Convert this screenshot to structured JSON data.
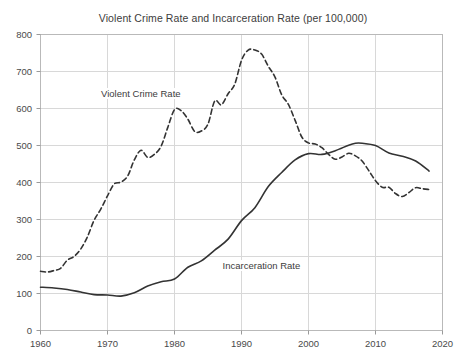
{
  "chart_data": {
    "type": "line",
    "title": "Violent Crime Rate and Incarceration Rate (per 100,000)",
    "xlabel": "",
    "ylabel": "",
    "xlim": [
      1960,
      2020
    ],
    "ylim": [
      0,
      800
    ],
    "grid": true,
    "legend_position": "inline-annotation",
    "xticks": [
      1960,
      1970,
      1980,
      1990,
      2000,
      2010,
      2020
    ],
    "yticks": [
      0,
      100,
      200,
      300,
      400,
      500,
      600,
      700,
      800
    ],
    "annotations": [
      {
        "text": "Violent Crime Rate",
        "x": 1975,
        "y": 640
      },
      {
        "text": "Incarceration Rate",
        "x": 1993,
        "y": 175
      }
    ],
    "series": [
      {
        "name": "Violent Crime Rate",
        "style": "dashed",
        "color": "#333333",
        "x": [
          1960,
          1961,
          1962,
          1963,
          1964,
          1965,
          1966,
          1967,
          1968,
          1969,
          1970,
          1971,
          1972,
          1973,
          1974,
          1975,
          1976,
          1977,
          1978,
          1979,
          1980,
          1981,
          1982,
          1983,
          1984,
          1985,
          1986,
          1987,
          1988,
          1989,
          1990,
          1991,
          1992,
          1993,
          1994,
          1995,
          1996,
          1997,
          1998,
          1999,
          2000,
          2001,
          2002,
          2003,
          2004,
          2005,
          2006,
          2007,
          2008,
          2009,
          2010,
          2011,
          2012,
          2013,
          2014,
          2015,
          2016,
          2017,
          2018
        ],
        "values": [
          160,
          158,
          162,
          168,
          190,
          200,
          220,
          253,
          298,
          328,
          364,
          396,
          401,
          417,
          461,
          487,
          468,
          476,
          498,
          549,
          597,
          594,
          571,
          538,
          539,
          558,
          620,
          610,
          640,
          666,
          730,
          758,
          758,
          747,
          714,
          685,
          637,
          611,
          568,
          523,
          507,
          504,
          494,
          476,
          463,
          469,
          479,
          472,
          458,
          432,
          405,
          387,
          387,
          370,
          362,
          373,
          386,
          383,
          381
        ]
      },
      {
        "name": "Incarceration Rate",
        "style": "solid",
        "color": "#333333",
        "x": [
          1960,
          1962,
          1964,
          1966,
          1968,
          1970,
          1972,
          1974,
          1976,
          1978,
          1980,
          1982,
          1984,
          1986,
          1988,
          1990,
          1992,
          1994,
          1996,
          1998,
          2000,
          2002,
          2004,
          2006,
          2007,
          2008,
          2010,
          2012,
          2014,
          2016,
          2018
        ],
        "values": [
          117,
          115,
          111,
          104,
          97,
          96,
          93,
          102,
          120,
          132,
          139,
          171,
          188,
          217,
          247,
          297,
          332,
          389,
          427,
          461,
          478,
          476,
          486,
          501,
          506,
          506,
          500,
          480,
          471,
          458,
          431
        ]
      }
    ]
  }
}
